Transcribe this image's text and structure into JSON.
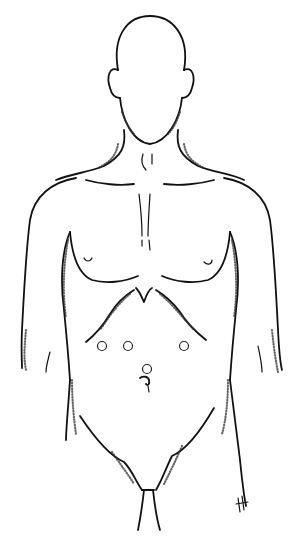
{
  "figure": {
    "line_color": "#111111",
    "background_color": "#ffffff",
    "port_sites": [
      {
        "name": "port-left-lateral",
        "cx": 102,
        "cy": 346,
        "r": 4.5
      },
      {
        "name": "port-left-medial",
        "cx": 128,
        "cy": 346,
        "r": 4.5
      },
      {
        "name": "port-right",
        "cx": 184,
        "cy": 346,
        "r": 4.5
      },
      {
        "name": "port-umbilical",
        "cx": 147,
        "cy": 369,
        "r": 4.5
      }
    ],
    "signature": "artist-initials"
  }
}
